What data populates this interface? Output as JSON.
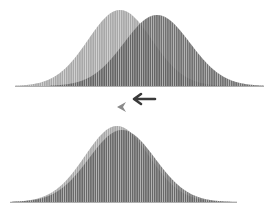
{
  "diagram": {
    "colors": {
      "light_curve": "#a8a8a8",
      "dark_curve": "#585858",
      "arrow_dark": "#3a3a3a",
      "arrow_light": "#8a8a8a",
      "hatch_gap": "#ffffff"
    },
    "top_panel": {
      "baseline_y": 86,
      "curves": [
        {
          "name": "light",
          "mean_x": 120,
          "sigma": 32,
          "peak_y": 10,
          "x_from": 15,
          "x_to": 228
        },
        {
          "name": "dark",
          "mean_x": 157,
          "sigma": 33,
          "peak_y": 15,
          "x_from": 50,
          "x_to": 264
        }
      ]
    },
    "arrows": [
      {
        "name": "arrow-dark",
        "direction": "left",
        "x": 133,
        "y": 99
      },
      {
        "name": "arrow-light",
        "direction": "left",
        "x": 117,
        "y": 107
      }
    ],
    "bottom_panel": {
      "baseline_y": 202,
      "curves": [
        {
          "name": "light",
          "mean_x": 117,
          "sigma": 32,
          "peak_y": 126,
          "x_from": 10,
          "x_to": 237
        },
        {
          "name": "dark",
          "mean_x": 122,
          "sigma": 33,
          "peak_y": 130,
          "x_from": 12,
          "x_to": 237
        }
      ]
    }
  }
}
